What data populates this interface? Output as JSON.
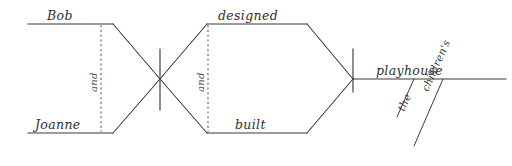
{
  "diagram": {
    "type": "reed-kellogg-sentence-diagram",
    "sentence": "Bob and Joanne designed and built the children's playhouse.",
    "ink_color": "#3a3a3a",
    "background_color": "#ffffff",
    "subjects": {
      "first": "Bob",
      "second": "Joanne",
      "conjunction": "and"
    },
    "verbs": {
      "first": "designed",
      "second": "built",
      "conjunction": "and"
    },
    "object": {
      "head": "playhouse",
      "modifiers": [
        {
          "word": "the"
        },
        {
          "word": "children's"
        }
      ]
    }
  }
}
